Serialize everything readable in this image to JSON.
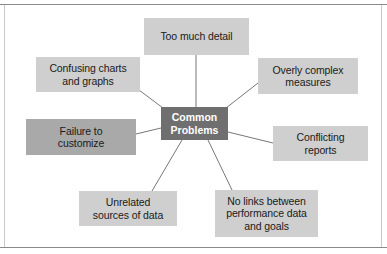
{
  "diagram": {
    "type": "hub-and-spoke",
    "title": "Common Problems",
    "hub": {
      "label": "Common Problems",
      "line1": "Common",
      "line2": "Problems",
      "color": "#6f6f6f",
      "text_color": "#ffffff"
    },
    "colors": {
      "node_light": "#cfcfcf",
      "node_dark": "#a9a9a9",
      "connector": "#777777",
      "rule": "#8a8a8a",
      "background": "#ffffff",
      "text": "#1a1a1a"
    },
    "nodes": [
      {
        "id": "too-much-detail",
        "label": "Too much detail",
        "lines": [
          "Too much detail"
        ],
        "shade": "light",
        "position": "top"
      },
      {
        "id": "confusing-charts-and-graphs",
        "label": "Confusing charts and graphs",
        "lines": [
          "Confusing charts",
          "and graphs"
        ],
        "shade": "light",
        "position": "upper-left"
      },
      {
        "id": "overly-complex-measures",
        "label": "Overly complex measures",
        "lines": [
          "Overly complex",
          "measures"
        ],
        "shade": "light",
        "position": "upper-right"
      },
      {
        "id": "failure-to-customize",
        "label": "Failure to customize",
        "lines": [
          "Failure to",
          "customize"
        ],
        "shade": "dark",
        "position": "left"
      },
      {
        "id": "conflicting-reports",
        "label": "Conflicting reports",
        "lines": [
          "Conflicting",
          "reports"
        ],
        "shade": "light",
        "position": "right"
      },
      {
        "id": "unrelated-sources-of-data",
        "label": "Unrelated sources of data",
        "lines": [
          "Unrelated",
          "sources of data"
        ],
        "shade": "light",
        "position": "lower-left"
      },
      {
        "id": "no-links-between-performance-data-and-goals",
        "label": "No links between performance data and goals",
        "lines": [
          "No links between",
          "performance data",
          "and goals"
        ],
        "shade": "light",
        "position": "lower-right"
      }
    ]
  }
}
